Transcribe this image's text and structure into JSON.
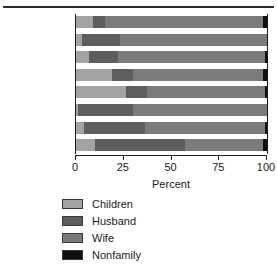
{
  "chart_data": {
    "type": "bar",
    "orientation": "horizontal",
    "stacked": true,
    "title": "",
    "xlabel": "Percent",
    "ylabel": "",
    "xlim": [
      0,
      100
    ],
    "xticks": [
      0,
      25,
      50,
      75,
      100
    ],
    "xtick_labels": [
      "0",
      "25",
      "50",
      "75",
      "100"
    ],
    "grid": false,
    "legend_position": "bottom-left",
    "categories": [
      "Laundry",
      "Shopping",
      "Cooking",
      "Cleaning",
      "Dishwashing",
      "Paperwork",
      "Childcare",
      "Yard work"
    ],
    "series": [
      {
        "name": "Children",
        "color": "#a3a3a3",
        "values": [
          9,
          3,
          7,
          19,
          26,
          1,
          4,
          10
        ]
      },
      {
        "name": "Husband",
        "color": "#5e5e5e",
        "values": [
          6,
          20,
          15,
          11,
          11,
          29,
          32,
          47
        ]
      },
      {
        "name": "Wife",
        "color": "#7b7b7b",
        "values": [
          83,
          77,
          77,
          68,
          62,
          70,
          63,
          41
        ]
      },
      {
        "name": "Nonfamily",
        "color": "#101010",
        "values": [
          2,
          0,
          1,
          2,
          1,
          0,
          1,
          2
        ]
      }
    ]
  },
  "legend": {
    "items": [
      {
        "label": "Children",
        "color": "#a3a3a3"
      },
      {
        "label": "Husband",
        "color": "#5e5e5e"
      },
      {
        "label": "Wife",
        "color": "#7b7b7b"
      },
      {
        "label": "Nonfamily",
        "color": "#101010"
      }
    ]
  }
}
